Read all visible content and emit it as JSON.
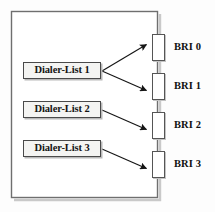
{
  "diagram": {
    "background_color": "#fdfdfd",
    "line_color": "#1a1a1a",
    "border_color": "#4a4a4a",
    "box_fill": "#f4f4f2",
    "port_fill": "#ffffff"
  },
  "chassis": {
    "name": "router-chassis",
    "x": 11,
    "y": 11,
    "width": 146,
    "height": 186
  },
  "dialer_lists": [
    {
      "id": "dialer-list-1",
      "label": "Dialer-List 1"
    },
    {
      "id": "dialer-list-2",
      "label": "Dialer-List 2"
    },
    {
      "id": "dialer-list-3",
      "label": "Dialer-List 3"
    }
  ],
  "bri_interfaces": [
    {
      "id": "bri-0",
      "label": "BRI 0"
    },
    {
      "id": "bri-1",
      "label": "BRI 1"
    },
    {
      "id": "bri-2",
      "label": "BRI 2"
    },
    {
      "id": "bri-3",
      "label": "BRI 3"
    }
  ],
  "connections": [
    {
      "from": "dialer-list-1",
      "to": "bri-0"
    },
    {
      "from": "dialer-list-1",
      "to": "bri-1"
    },
    {
      "from": "dialer-list-2",
      "to": "bri-2"
    },
    {
      "from": "dialer-list-3",
      "to": "bri-3"
    }
  ]
}
